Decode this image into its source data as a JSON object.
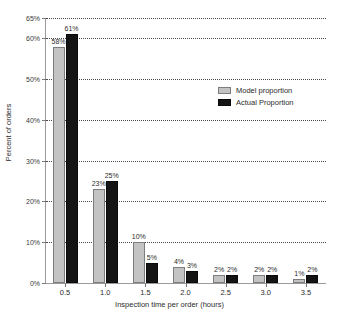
{
  "chart_data": {
    "type": "bar",
    "title": "",
    "xlabel": "Inspection time per order (hours)",
    "ylabel": "Percent of orders",
    "categories": [
      "0.5",
      "1.0",
      "1.5",
      "2.0",
      "2.5",
      "3.0",
      "3.5"
    ],
    "series": [
      {
        "name": "Model proportion",
        "color": "#c3c3c3",
        "values": [
          58,
          23,
          10,
          4,
          2,
          2,
          1
        ],
        "labels": [
          "58%",
          "23%",
          "10%",
          "4%",
          "2%",
          "2%",
          "1%"
        ]
      },
      {
        "name": "Actual Proportion",
        "color": "#141414",
        "values": [
          61,
          25,
          5,
          3,
          2,
          2,
          2
        ],
        "labels": [
          "61%",
          "25%",
          "5%",
          "3%",
          "2%",
          "2%",
          "2%"
        ]
      }
    ],
    "ylim": [
      0,
      65
    ],
    "yticks": [
      0,
      10,
      20,
      30,
      40,
      50,
      60,
      65
    ],
    "ytick_labels": [
      "0%",
      "10%",
      "20%",
      "30%",
      "40%",
      "50%",
      "60%",
      "65%"
    ],
    "grid": true,
    "grid_axis": "y",
    "grid_style": "dotted",
    "legend_position": "upper-right"
  },
  "legend": {
    "entries": [
      {
        "label": "Model proportion",
        "swatch": "model"
      },
      {
        "label": "Actual Proportion",
        "swatch": "actual"
      }
    ]
  },
  "axes": {
    "x_title": "Inspection time per order (hours)",
    "y_title": "Percent of orders"
  }
}
